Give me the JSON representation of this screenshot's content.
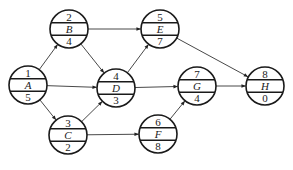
{
  "diagram": {
    "type": "network-activity-on-node",
    "nodes": [
      {
        "id": "A",
        "top": "1",
        "label": "A",
        "bottom": "5",
        "cx": 28,
        "cy": 85
      },
      {
        "id": "B",
        "top": "2",
        "label": "B",
        "bottom": "4",
        "cx": 69,
        "cy": 29
      },
      {
        "id": "C",
        "top": "3",
        "label": "C",
        "bottom": "2",
        "cx": 68,
        "cy": 135
      },
      {
        "id": "D",
        "top": "4",
        "label": "D",
        "bottom": "3",
        "cx": 116,
        "cy": 88
      },
      {
        "id": "E",
        "top": "5",
        "label": "E",
        "bottom": "7",
        "cx": 160,
        "cy": 29
      },
      {
        "id": "F",
        "top": "6",
        "label": "F",
        "bottom": "8",
        "cx": 158,
        "cy": 134
      },
      {
        "id": "G",
        "top": "7",
        "label": "G",
        "bottom": "4",
        "cx": 197,
        "cy": 86
      },
      {
        "id": "H",
        "top": "8",
        "label": "H",
        "bottom": "0",
        "cx": 265,
        "cy": 86
      }
    ],
    "edges": [
      {
        "from": "A",
        "to": "B"
      },
      {
        "from": "A",
        "to": "D"
      },
      {
        "from": "A",
        "to": "C"
      },
      {
        "from": "B",
        "to": "E"
      },
      {
        "from": "B",
        "to": "D"
      },
      {
        "from": "C",
        "to": "D"
      },
      {
        "from": "C",
        "to": "F"
      },
      {
        "from": "D",
        "to": "E"
      },
      {
        "from": "D",
        "to": "G"
      },
      {
        "from": "E",
        "to": "H"
      },
      {
        "from": "F",
        "to": "G"
      },
      {
        "from": "G",
        "to": "H"
      }
    ],
    "radius": 19
  }
}
